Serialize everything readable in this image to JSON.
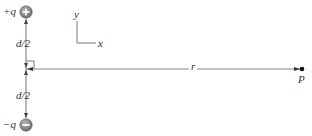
{
  "diagram": {
    "type": "electric dipole field point geometry",
    "charges": {
      "positive": {
        "label": "+q",
        "symbol": "+"
      },
      "negative": {
        "label": "−q",
        "symbol": "−"
      }
    },
    "segments": {
      "upper_half": "d/2",
      "lower_half": "d/2",
      "distance": "r"
    },
    "point": {
      "label": "P"
    },
    "axes": {
      "x_label": "x",
      "y_label": "y"
    },
    "colors": {
      "line": "#555555",
      "charge_fill": "#8a8a8a",
      "charge_symbol": "#ffffff",
      "text": "#333333",
      "point": "#111111"
    }
  }
}
